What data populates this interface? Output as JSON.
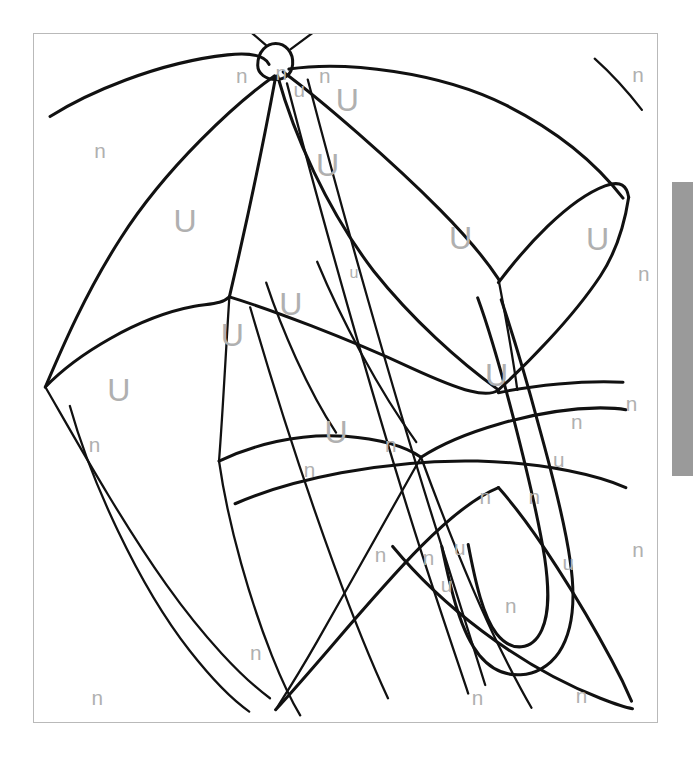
{
  "page": {
    "background_color": "#ffffff",
    "frame_color": "#b9b9b9",
    "ink_color": "#111111",
    "letter_color": "#b0b0b0"
  },
  "scrollbar": {
    "name": "vertical-scrollbar",
    "thumb_color": "#9a9a9a",
    "track_color": "#ffffff",
    "thumb_top": 182,
    "thumb_height": 294
  },
  "artwork": {
    "subject": "umbrella",
    "description": "Open umbrella line drawing with a curved hook handle, divided into panels labelled with letters",
    "legend_letters": [
      "U",
      "u",
      "n"
    ],
    "letters": [
      {
        "id": "l01",
        "char": "U",
        "size": "U",
        "x": 332,
        "y": 72,
        "name": "letter-U"
      },
      {
        "id": "l02",
        "char": "U",
        "size": "U",
        "x": 311,
        "y": 141,
        "name": "letter-U"
      },
      {
        "id": "l03",
        "char": "U",
        "size": "U",
        "x": 160,
        "y": 200,
        "name": "letter-U"
      },
      {
        "id": "l04",
        "char": "U",
        "size": "U",
        "x": 452,
        "y": 218,
        "name": "letter-U"
      },
      {
        "id": "l05",
        "char": "U",
        "size": "U",
        "x": 597,
        "y": 219,
        "name": "letter-U"
      },
      {
        "id": "l06",
        "char": "U",
        "size": "U",
        "x": 272,
        "y": 287,
        "name": "letter-U"
      },
      {
        "id": "l07",
        "char": "U",
        "size": "U",
        "x": 210,
        "y": 320,
        "name": "letter-U"
      },
      {
        "id": "l08",
        "char": "U",
        "size": "U",
        "x": 490,
        "y": 362,
        "name": "letter-U"
      },
      {
        "id": "l09",
        "char": "U",
        "size": "U",
        "x": 90,
        "y": 378,
        "name": "letter-U"
      },
      {
        "id": "l10",
        "char": "U",
        "size": "U",
        "x": 320,
        "y": 422,
        "name": "letter-U"
      },
      {
        "id": "l11",
        "char": "u",
        "size": "u",
        "x": 281,
        "y": 61,
        "name": "letter-u"
      },
      {
        "id": "l12",
        "char": "u",
        "size": "u-small",
        "x": 339,
        "y": 253,
        "name": "letter-u"
      },
      {
        "id": "l13",
        "char": "u",
        "size": "u",
        "x": 556,
        "y": 451,
        "name": "letter-u"
      },
      {
        "id": "l14",
        "char": "u",
        "size": "u",
        "x": 451,
        "y": 543,
        "name": "letter-u"
      },
      {
        "id": "l15",
        "char": "u",
        "size": "u",
        "x": 566,
        "y": 559,
        "name": "letter-u"
      },
      {
        "id": "l16",
        "char": "u",
        "size": "u",
        "x": 437,
        "y": 582,
        "name": "letter-u"
      },
      {
        "id": "n01",
        "char": "n",
        "size": "n",
        "x": 220,
        "y": 46,
        "name": "letter-n"
      },
      {
        "id": "n02",
        "char": "n",
        "size": "n",
        "x": 262,
        "y": 43,
        "name": "letter-n"
      },
      {
        "id": "n03",
        "char": "n",
        "size": "n",
        "x": 308,
        "y": 46,
        "name": "letter-n"
      },
      {
        "id": "n04",
        "char": "n",
        "size": "n",
        "x": 640,
        "y": 45,
        "name": "letter-n"
      },
      {
        "id": "n05",
        "char": "n",
        "size": "n",
        "x": 70,
        "y": 125,
        "name": "letter-n"
      },
      {
        "id": "n06",
        "char": "n",
        "size": "n",
        "x": 646,
        "y": 254,
        "name": "letter-n"
      },
      {
        "id": "n07",
        "char": "n",
        "size": "n",
        "x": 64,
        "y": 435,
        "name": "letter-n"
      },
      {
        "id": "n08",
        "char": "n",
        "size": "n",
        "x": 633,
        "y": 392,
        "name": "letter-n"
      },
      {
        "id": "n09",
        "char": "n",
        "size": "n",
        "x": 378,
        "y": 435,
        "name": "letter-n"
      },
      {
        "id": "n10",
        "char": "n",
        "size": "n",
        "x": 575,
        "y": 410,
        "name": "letter-n"
      },
      {
        "id": "n11",
        "char": "n",
        "size": "n",
        "x": 292,
        "y": 461,
        "name": "letter-n"
      },
      {
        "id": "n12",
        "char": "n",
        "size": "n",
        "x": 478,
        "y": 490,
        "name": "letter-n"
      },
      {
        "id": "n13",
        "char": "n",
        "size": "n",
        "x": 530,
        "y": 489,
        "name": "letter-n"
      },
      {
        "id": "n14",
        "char": "n",
        "size": "n",
        "x": 640,
        "y": 545,
        "name": "letter-n"
      },
      {
        "id": "n15",
        "char": "n",
        "size": "n",
        "x": 367,
        "y": 551,
        "name": "letter-n"
      },
      {
        "id": "n16",
        "char": "n",
        "size": "n",
        "x": 418,
        "y": 554,
        "name": "letter-n"
      },
      {
        "id": "n17",
        "char": "n",
        "size": "n",
        "x": 505,
        "y": 604,
        "name": "letter-n"
      },
      {
        "id": "n18",
        "char": "n",
        "size": "n",
        "x": 235,
        "y": 654,
        "name": "letter-n"
      },
      {
        "id": "n19",
        "char": "n",
        "size": "n",
        "x": 67,
        "y": 701,
        "name": "letter-n"
      },
      {
        "id": "n20",
        "char": "n",
        "size": "n",
        "x": 470,
        "y": 701,
        "name": "letter-n"
      },
      {
        "id": "n21",
        "char": "n",
        "size": "n",
        "x": 580,
        "y": 699,
        "name": "letter-n"
      }
    ],
    "strokes": [
      {
        "id": "s01",
        "name": "canopy-left-outer-edge",
        "weight": "thick",
        "d": "M 17 87 C 55 63 130 30 205 22 C 233 19 245 24 249 32"
      },
      {
        "id": "s02",
        "name": "canopy-top-knob",
        "weight": "thick",
        "d": "M 237 33 C 237 18 247 10 256 10 C 266 10 275 19 274 32 C 273 43 265 48 256 48 C 246 48 237 42 237 33 Z"
      },
      {
        "id": "s03",
        "name": "canopy-tip-spike-left",
        "weight": "med",
        "d": "M 246 12 L 218 -12"
      },
      {
        "id": "s04",
        "name": "canopy-tip-spike-right",
        "weight": "med",
        "d": "M 272 16 L 299 -4"
      },
      {
        "id": "s05",
        "name": "canopy-right-outer-edge",
        "weight": "thick",
        "d": "M 270 37 C 330 28 430 40 500 75 C 560 105 600 142 624 173"
      },
      {
        "id": "s06",
        "name": "canopy-rib-far-left",
        "weight": "thick",
        "d": "M 255 44 C 215 72 140 140 92 215 C 55 272 30 330 12 372"
      },
      {
        "id": "s07",
        "name": "canopy-rib-left",
        "weight": "thick",
        "d": "M 256 45 C 244 110 225 200 207 277"
      },
      {
        "id": "s08",
        "name": "canopy-rib-center",
        "weight": "thick",
        "d": "M 258 44 C 275 105 310 185 360 250 C 400 300 450 345 492 375"
      },
      {
        "id": "s09",
        "name": "canopy-rib-right",
        "weight": "thick",
        "d": "M 264 40 C 305 70 380 135 430 185 C 460 215 480 240 492 258"
      },
      {
        "id": "s10",
        "name": "canopy-scallop-left",
        "weight": "thick",
        "d": "M 12 372 C 45 338 110 298 170 287 C 188 284 200 284 207 277"
      },
      {
        "id": "s11",
        "name": "canopy-scallop-mid",
        "weight": "thick",
        "d": "M 207 277 C 250 290 330 320 400 352 C 455 377 480 384 492 375"
      },
      {
        "id": "s12",
        "name": "canopy-scallop-right",
        "weight": "thick",
        "d": "M 492 262 C 520 225 565 175 605 160 C 622 154 628 160 630 172"
      },
      {
        "id": "s13",
        "name": "canopy-scallop-far-right",
        "weight": "thick",
        "d": "M 492 375 C 520 350 570 300 600 255 C 618 228 626 198 630 172"
      },
      {
        "id": "s14",
        "name": "canopy-scallop-right-outer",
        "weight": "thick",
        "d": "M 492 378 C 530 370 580 365 624 367"
      },
      {
        "id": "s15",
        "name": "canopy-panel-line-a",
        "weight": "med",
        "d": "M 207 277 C 204 320 200 400 196 450"
      },
      {
        "id": "s16",
        "name": "canopy-panel-line-b",
        "weight": "med",
        "d": "M 229 288 C 250 360 285 470 318 560 C 340 620 360 668 375 700"
      },
      {
        "id": "s17",
        "name": "canopy-panel-line-c",
        "weight": "med",
        "d": "M 12 372 C 40 420 90 510 140 580 C 180 636 220 678 250 700"
      },
      {
        "id": "s18",
        "name": "lower-canopy-left-edge",
        "weight": "thick",
        "d": "M 196 450 C 230 434 280 420 330 424 C 370 427 395 436 410 446"
      },
      {
        "id": "s19",
        "name": "lower-canopy-right-arc",
        "weight": "thick",
        "d": "M 410 446 C 450 420 530 395 600 394 C 614 394 622 395 627 396"
      },
      {
        "id": "s20",
        "name": "lower-canopy-deep-arc",
        "weight": "thick",
        "d": "M 213 495 C 270 470 370 448 470 450 C 545 452 600 466 627 478"
      },
      {
        "id": "s21",
        "name": "canopy-lower-rib-1",
        "weight": "med",
        "d": "M 410 446 C 385 490 340 570 300 640 C 280 675 265 698 256 712"
      },
      {
        "id": "s22",
        "name": "canopy-lower-rib-2",
        "weight": "med",
        "d": "M 410 446 C 430 500 460 580 495 650 C 510 680 520 698 527 710"
      },
      {
        "id": "s23",
        "name": "canopy-lower-scallop",
        "weight": "thick",
        "d": "M 256 712 C 300 665 360 590 410 540 C 445 505 470 487 492 478"
      },
      {
        "id": "s24",
        "name": "canopy-lower-scallop-right",
        "weight": "thick",
        "d": "M 492 478 C 530 520 580 600 612 660 C 624 682 630 696 633 703"
      },
      {
        "id": "s25",
        "name": "canopy-bottom-right-arc",
        "weight": "thick",
        "d": "M 380 540 C 430 600 510 665 600 700 C 618 707 628 710 634 711"
      },
      {
        "id": "s26",
        "name": "shaft-left-line",
        "weight": "med",
        "d": "M 268 52 C 300 175 360 390 410 545 C 432 613 450 665 460 695"
      },
      {
        "id": "s27",
        "name": "shaft-right-line",
        "weight": "med",
        "d": "M 290 48 C 322 170 382 385 432 540 C 452 605 468 655 478 686"
      },
      {
        "id": "s28",
        "name": "handle-hook-outer",
        "weight": "thick",
        "d": "M 432 540 C 442 588 452 630 472 655 C 496 684 536 681 556 652 C 572 628 574 595 568 555 C 562 512 548 460 534 410 C 520 358 505 310 495 280"
      },
      {
        "id": "s29",
        "name": "handle-hook-inner",
        "weight": "thick",
        "d": "M 460 538 C 468 580 476 614 490 632 C 506 652 528 650 538 628 C 546 610 546 586 541 552 C 534 508 521 455 508 405 C 494 352 480 305 470 278"
      },
      {
        "id": "s30",
        "name": "shaft-top-panel-left",
        "weight": "med",
        "d": "M 246 262 C 262 310 290 375 320 420"
      },
      {
        "id": "s31",
        "name": "shaft-top-panel-right",
        "weight": "med",
        "d": "M 300 240 C 325 300 365 375 405 430"
      },
      {
        "id": "s32",
        "name": "left-lower-long-curve",
        "weight": "med",
        "d": "M 38 392 C 60 470 110 580 165 650 C 195 688 215 705 228 714"
      },
      {
        "id": "s33",
        "name": "bottom-center-curve",
        "weight": "med",
        "d": "M 196 450 C 206 520 230 600 252 655 C 266 690 276 708 282 718"
      },
      {
        "id": "s34",
        "name": "right-outer-top-corner-arc",
        "weight": "med",
        "d": "M 594 26 C 612 42 630 62 644 80"
      },
      {
        "id": "s35",
        "name": "canopy-mid-right-rib",
        "weight": "med",
        "d": "M 492 258 C 500 300 508 345 512 375"
      }
    ]
  }
}
